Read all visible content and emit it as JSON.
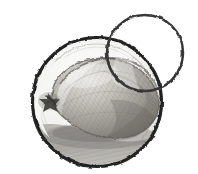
{
  "artwork": {
    "title": "Pencil sketch of a pear-shaped fruit inside a circle",
    "medium": "graphite pencil sketch, grayscale",
    "background_color": "#ffffff",
    "canvas": {
      "width": 198,
      "height": 174
    },
    "caption": "A shaded pear-like gourd drawn inside a hand-drawn circular frame, with a second empty circle outline overlapping at the upper right."
  },
  "palette": {
    "background": "#ffffff",
    "outline_dark": "#2b2b2b",
    "outline_mid": "#5a5a5a",
    "paper_tint": "#f2f2f0",
    "fruit_light": "#d9d7d2",
    "fruit_mid": "#a9a7a1",
    "fruit_dark": "#6f6d68",
    "stem_scar": "#3a3833",
    "shadow": "#8d8b86",
    "table_light": "#cfcdc8"
  },
  "shapes": {
    "main_circle": {
      "name": "main-circle",
      "cx": 97,
      "cy": 102,
      "r": 65,
      "stroke": "#2b2b2b",
      "stroke_width": 3,
      "fill": "#f2f2f0",
      "label": "Large hand-drawn circle containing the fruit"
    },
    "small_circle": {
      "name": "overlap-circle",
      "cx": 145,
      "cy": 53,
      "r": 38,
      "stroke": "#3c3c3c",
      "stroke_width": 2.4,
      "fill": "none",
      "label": "Empty hand-drawn circle overlapping upper right"
    },
    "fruit": {
      "name": "pear-body",
      "label": "Shaded pear / gourd body",
      "path": "M 52 96 C 52 74, 76 58, 104 58 C 130 58, 152 74, 158 96 C 163 114, 150 133, 128 137 C 105 141, 86 134, 72 124 C 58 114, 52 106, 52 96 Z",
      "highlight_label": "Upper-left highlight band",
      "outline_color": "#5a5a5a"
    },
    "stem_scar": {
      "name": "stem-scar",
      "cx": 50,
      "cy": 101,
      "label": "Dark star-shaped stem scar on the left of the fruit",
      "color": "#3a3833"
    },
    "surface_shadow": {
      "name": "surface-shadow",
      "label": "Hatched table surface and cast shadow at the bottom of the circle",
      "color": "#9d9b96"
    },
    "inner_rim": {
      "name": "inner-rim",
      "label": "Faint inner rim line inside the main circle",
      "color": "#bdbbb6"
    }
  }
}
